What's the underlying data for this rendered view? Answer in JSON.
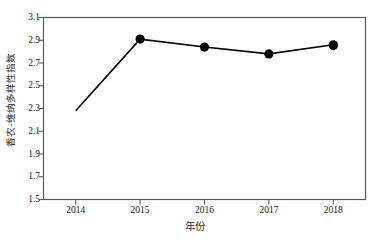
{
  "chart_data": {
    "type": "line",
    "title": "",
    "xlabel": "年份",
    "ylabel": "香农-维纳多样性指数",
    "categories": [
      "2014",
      "2015",
      "2016",
      "2017",
      "2018"
    ],
    "x": [
      2014,
      2015,
      2016,
      2017,
      2018
    ],
    "values": [
      2.28,
      2.91,
      2.84,
      2.78,
      2.86
    ],
    "series": [
      {
        "name": "香农-维纳多样性指数",
        "values": [
          2.28,
          2.91,
          2.84,
          2.78,
          2.86
        ]
      }
    ],
    "ylim": [
      1.5,
      3.1
    ],
    "yticks": [
      "1.5",
      "1.7",
      "1.9",
      "2.1",
      "2.3",
      "2.5",
      "2.7",
      "2.9",
      "3.1"
    ],
    "ytick_values": [
      1.5,
      1.7,
      1.9,
      2.1,
      2.3,
      2.5,
      2.7,
      2.9,
      3.1
    ],
    "xticks": [
      "2014",
      "2015",
      "2016",
      "2017",
      "2018"
    ],
    "grid": false,
    "legend": "none",
    "marker": "filled-circle",
    "marker_color": "#000000",
    "line_color": "#000000",
    "plot_border": true,
    "background_color": "#ffffff"
  }
}
